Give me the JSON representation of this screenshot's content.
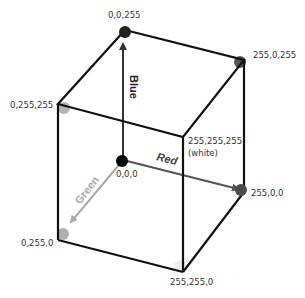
{
  "diagram": {
    "vertices": [
      {
        "id": "blue",
        "label": "0,0,255",
        "color": "#222222"
      },
      {
        "id": "magenta",
        "label": "255,0,255",
        "color": "#555555"
      },
      {
        "id": "cyan",
        "label": "0,255,255",
        "color": "#b5b5b5"
      },
      {
        "id": "white",
        "label": "255,255,255",
        "sublabel": "(white)",
        "color": "#ffffff"
      },
      {
        "id": "black",
        "label": "0,0,0",
        "color": "#000000"
      },
      {
        "id": "red",
        "label": "255,0,0",
        "color": "#4a4a4a"
      },
      {
        "id": "green",
        "label": "0,255,0",
        "color": "#b0b0b0"
      },
      {
        "id": "yellow",
        "label": "255,255,0",
        "color": "#eeeeee"
      }
    ],
    "axes": [
      {
        "name": "Blue",
        "color": "#222222"
      },
      {
        "name": "Red",
        "color": "#444444"
      },
      {
        "name": "Green",
        "color": "#aaaaaa"
      }
    ]
  }
}
